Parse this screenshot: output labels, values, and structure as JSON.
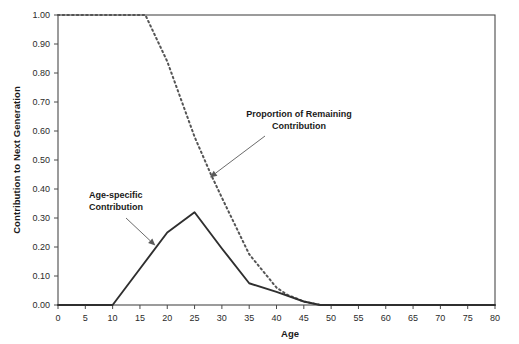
{
  "chart_data": {
    "type": "line",
    "title": "",
    "xlabel": "Age",
    "ylabel": "Contribution to Next Generation",
    "xlim": [
      0,
      80
    ],
    "ylim": [
      0.0,
      1.0
    ],
    "grid": false,
    "legend": "none (inline annotations with arrows)",
    "xticks": [
      "0",
      "5",
      "10",
      "15",
      "20",
      "25",
      "30",
      "35",
      "40",
      "45",
      "50",
      "55",
      "60",
      "65",
      "70",
      "75",
      "80"
    ],
    "xtick_values": [
      0,
      5,
      10,
      15,
      20,
      25,
      30,
      35,
      40,
      45,
      50,
      55,
      60,
      65,
      70,
      75,
      80
    ],
    "yticks": [
      "0.00",
      "0.10",
      "0.20",
      "0.30",
      "0.40",
      "0.50",
      "0.60",
      "0.70",
      "0.80",
      "0.90",
      "1.00"
    ],
    "ytick_values": [
      0.0,
      0.1,
      0.2,
      0.3,
      0.4,
      0.5,
      0.6,
      0.7,
      0.8,
      0.9,
      1.0
    ],
    "series": [
      {
        "name": "Age-specific Contribution",
        "style": "solid",
        "color": "#2f2f2f",
        "x": [
          0,
          5,
          10,
          15,
          20,
          25,
          30,
          35,
          40,
          45,
          48,
          50,
          60,
          70,
          80
        ],
        "values": [
          0.0,
          0.0,
          0.0,
          0.125,
          0.25,
          0.32,
          0.195,
          0.075,
          0.045,
          0.012,
          0.0,
          0.0,
          0.0,
          0.0,
          0.0
        ]
      },
      {
        "name": "Proportion of Remaining Contribution",
        "style": "dashed",
        "color": "#555555",
        "x": [
          0,
          5,
          10,
          15,
          16,
          20,
          25,
          28,
          30,
          35,
          40,
          42,
          45,
          48,
          50
        ],
        "values": [
          1.0,
          1.0,
          1.0,
          1.0,
          1.0,
          0.84,
          0.58,
          0.45,
          0.37,
          0.175,
          0.06,
          0.035,
          0.012,
          0.0,
          0.0
        ]
      }
    ],
    "annotations": [
      {
        "id": "annotation-remaining",
        "text_line1": "Proportion of Remaining",
        "text_line2": "Contribution",
        "points_to_series": "Proportion of Remaining Contribution",
        "points_to_x": 28,
        "points_to_y": 0.44
      },
      {
        "id": "annotation-age-specific",
        "text_line1": "Age-specific",
        "text_line2": "Contribution",
        "points_to_series": "Age-specific Contribution",
        "points_to_x": 18,
        "points_to_y": 0.205
      }
    ]
  },
  "colors": {
    "background": "#ffffff",
    "axis": "#4a4a4a",
    "solid_series": "#2f2f2f",
    "dashed_series": "#555555",
    "text": "#1a1a1a",
    "annotation_arrow": "#5a5a5a"
  }
}
